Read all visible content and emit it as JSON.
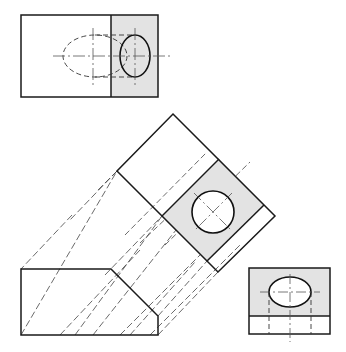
{
  "colors": {
    "line": "#1a1a1a",
    "hidden": "#333333",
    "center": "#555555",
    "shade": "#e3e3e3",
    "background": "#ffffff"
  },
  "views": {
    "top": {
      "label": "Top view",
      "outline": [
        21,
        15,
        137,
        82
      ],
      "divider_x": 111,
      "shaded": [
        111,
        15,
        47,
        82
      ],
      "hole_ellipse": {
        "cx": 135,
        "cy": 56,
        "rx": 15,
        "ry": 21
      },
      "hidden_ellipse": {
        "cx": 95,
        "cy": 56,
        "rx": 32,
        "ry": 21
      }
    },
    "auxiliary": {
      "label": "Auxiliary view",
      "outline": [
        [
          173,
          114
        ],
        [
          275,
          216
        ],
        [
          218,
          272
        ],
        [
          117,
          171
        ]
      ],
      "shaded": [
        [
          162,
          216
        ],
        [
          219,
          159
        ],
        [
          264,
          205
        ],
        [
          207,
          261
        ]
      ],
      "hole_circle": {
        "cx": 213,
        "cy": 212,
        "r": 21
      }
    },
    "front": {
      "label": "Front view",
      "outline": [
        [
          21,
          269
        ],
        [
          111,
          269
        ],
        [
          158,
          316
        ],
        [
          158,
          335
        ],
        [
          21,
          335
        ]
      ]
    },
    "side": {
      "label": "Right side view",
      "outline": [
        249,
        268,
        81,
        66
      ],
      "divider_y": 316,
      "shaded": [
        249,
        268,
        81,
        48
      ],
      "hole_ellipse": {
        "cx": 290,
        "cy": 292,
        "rx": 21,
        "ry": 15
      }
    }
  }
}
